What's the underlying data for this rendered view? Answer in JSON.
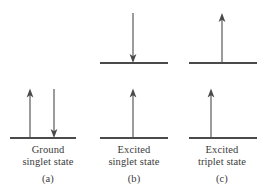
{
  "figure": {
    "stroke_color": "#4a4a4a",
    "text_color": "#3a3a3a",
    "background_color": "#ffffff"
  },
  "panels": [
    {
      "id": "a",
      "tag": "(a)",
      "title_line1": "Ground",
      "title_line2": "singlet state",
      "levels": {
        "lower": {
          "present": true,
          "x1": 10,
          "x2": 76,
          "y": 138
        },
        "upper": {
          "present": false,
          "x1": 10,
          "x2": 76,
          "y": 63
        }
      },
      "arrows": [
        {
          "name": "ground-spin-up-arrow",
          "level": "lower",
          "direction": "up",
          "x": 30,
          "tail_y": 138,
          "head_y": 89
        },
        {
          "name": "ground-spin-down-arrow",
          "level": "lower",
          "direction": "down",
          "x": 54,
          "tail_y": 89,
          "head_y": 138
        }
      ]
    },
    {
      "id": "b",
      "tag": "(b)",
      "title_line1": "Excited",
      "title_line2": "singlet state",
      "levels": {
        "lower": {
          "present": true,
          "x1": 100,
          "x2": 168,
          "y": 138
        },
        "upper": {
          "present": true,
          "x1": 100,
          "x2": 168,
          "y": 63
        }
      },
      "arrows": [
        {
          "name": "excited-singlet-upper-spin-down-arrow",
          "level": "upper",
          "direction": "down",
          "x": 133,
          "tail_y": 13,
          "head_y": 63
        },
        {
          "name": "excited-singlet-lower-spin-up-arrow",
          "level": "lower",
          "direction": "up",
          "x": 133,
          "tail_y": 138,
          "head_y": 89
        }
      ]
    },
    {
      "id": "c",
      "tag": "(c)",
      "title_line1": "Excited",
      "title_line2": "triplet state",
      "levels": {
        "lower": {
          "present": true,
          "x1": 189,
          "x2": 257,
          "y": 138
        },
        "upper": {
          "present": true,
          "x1": 189,
          "x2": 257,
          "y": 63
        }
      },
      "arrows": [
        {
          "name": "excited-triplet-upper-spin-up-arrow",
          "level": "upper",
          "direction": "up",
          "x": 222,
          "tail_y": 63,
          "head_y": 13
        },
        {
          "name": "excited-triplet-lower-spin-up-arrow",
          "level": "lower",
          "direction": "up",
          "x": 211,
          "tail_y": 138,
          "head_y": 89
        }
      ]
    }
  ]
}
